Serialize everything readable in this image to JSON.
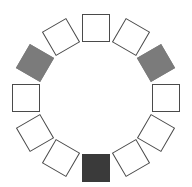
{
  "diagram": {
    "type": "ring-of-squares",
    "center": [
      95.5,
      97.5
    ],
    "radius": 70,
    "square_size": 28,
    "stroke_color": "#4a4a4a",
    "squares": [
      {
        "position": "12 o'clock",
        "angle": 0,
        "fill": "#ffffff"
      },
      {
        "position": "1 o'clock",
        "angle": 30,
        "fill": "#ffffff"
      },
      {
        "position": "2 o'clock",
        "angle": 60,
        "fill": "#7b7b7b"
      },
      {
        "position": "3 o'clock",
        "angle": 90,
        "fill": "#ffffff"
      },
      {
        "position": "4 o'clock",
        "angle": 120,
        "fill": "#ffffff"
      },
      {
        "position": "5 o'clock",
        "angle": 150,
        "fill": "#ffffff"
      },
      {
        "position": "6 o'clock",
        "angle": 180,
        "fill": "#3a3a3a"
      },
      {
        "position": "7 o'clock",
        "angle": 210,
        "fill": "#ffffff"
      },
      {
        "position": "8 o'clock",
        "angle": 240,
        "fill": "#ffffff"
      },
      {
        "position": "9 o'clock",
        "angle": 270,
        "fill": "#ffffff"
      },
      {
        "position": "10 o'clock",
        "angle": 300,
        "fill": "#7b7b7b"
      },
      {
        "position": "11 o'clock",
        "angle": 330,
        "fill": "#ffffff"
      }
    ]
  }
}
